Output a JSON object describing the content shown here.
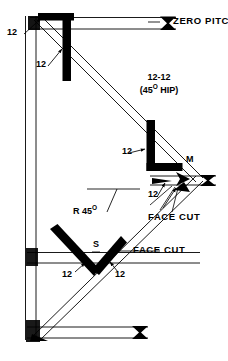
{
  "figure": {
    "title_alt": "Framing square layout for 12-12 (45 degree) hip rafter",
    "ink_color": "#000000",
    "background_color": "#ffffff",
    "width": 228,
    "height": 361
  },
  "labels": {
    "zero_pitch": "ZERO PITCH",
    "rise_top_left": "12",
    "rise_upper_inner": "12",
    "hip_ratio": "12-12",
    "hip_angle": "(45",
    "hip_angle_sup": "O",
    "hip_angle_tail": " HIP)",
    "rise_mid": "12",
    "mark_m": "M",
    "run_mid": "12",
    "r45_prefix": "R 45",
    "r45_sup": "O",
    "face_cut_upper": "FACE CUT",
    "mark_s": "S",
    "run_lower_left": "12",
    "run_lower_right": "12",
    "face_cut_lower": "FACE CUT"
  }
}
